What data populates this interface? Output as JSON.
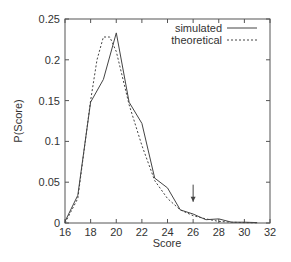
{
  "chart_data": {
    "type": "line",
    "title": "",
    "xlabel": "Score",
    "ylabel": "P(Score)",
    "xlim": [
      16,
      32
    ],
    "ylim": [
      0,
      0.25
    ],
    "xticks": [
      16,
      18,
      20,
      22,
      24,
      26,
      28,
      30,
      32
    ],
    "xtick_labels": [
      "16",
      "18",
      "20",
      "22",
      "24",
      "26",
      "28",
      "30",
      "32"
    ],
    "yticks": [
      0,
      0.05,
      0.1,
      0.15,
      0.2,
      0.25
    ],
    "ytick_labels": [
      "0",
      "0.05",
      "0.1",
      "0.15",
      "0.2",
      "0.25"
    ],
    "grid": false,
    "legend_position": "top-right",
    "series": [
      {
        "name": "simulated",
        "style": "solid",
        "x": [
          16,
          17,
          18,
          19,
          20,
          21,
          22,
          23,
          24,
          25,
          26,
          27,
          28,
          29,
          30,
          31
        ],
        "y": [
          0.002,
          0.034,
          0.148,
          0.176,
          0.233,
          0.148,
          0.122,
          0.055,
          0.043,
          0.016,
          0.011,
          0.004,
          0.005,
          0.001,
          0.001,
          0.0005
        ]
      },
      {
        "name": "theoretical",
        "style": "dashed",
        "x": [
          16,
          17,
          18,
          18.5,
          19,
          19.5,
          20,
          21,
          22,
          23,
          24,
          25,
          26,
          27,
          28,
          29,
          30,
          31
        ],
        "y": [
          0.0,
          0.03,
          0.15,
          0.2,
          0.228,
          0.228,
          0.21,
          0.145,
          0.095,
          0.052,
          0.03,
          0.016,
          0.009,
          0.005,
          0.002,
          0.001,
          0.0005,
          0.0002
        ]
      }
    ],
    "annotations": [
      {
        "type": "arrow",
        "x": 26,
        "y_from": 0.047,
        "y_to": 0.026,
        "direction": "down"
      }
    ]
  },
  "legend": {
    "items": [
      {
        "label": "simulated",
        "style": "solid"
      },
      {
        "label": "theoretical",
        "style": "dashed"
      }
    ]
  },
  "axes": {
    "xlabel": "Score",
    "ylabel": "P(Score)"
  }
}
